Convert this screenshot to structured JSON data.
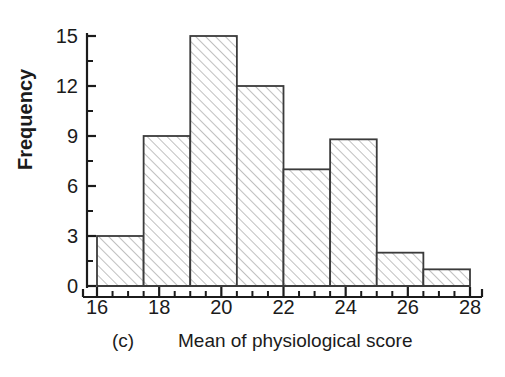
{
  "figure": {
    "panel_tag": "(c)",
    "caption": "Mean of physiological score",
    "ylabel": "Frequency"
  },
  "axes": {
    "y_ticks_major": [
      "0",
      "3",
      "6",
      "9",
      "12",
      "15"
    ],
    "x_ticks_major": [
      "16",
      "18",
      "20",
      "22",
      "24",
      "26",
      "28"
    ]
  },
  "style": {
    "ink": "#1b1b1b",
    "bar_edge": "#3b3b3b",
    "hatch": "#8c8c8c",
    "bar_face": "#ffffff"
  },
  "chart_data": {
    "type": "bar",
    "title": "",
    "subtitle": "",
    "xlabel": "Mean of physiological score",
    "ylabel": "Frequency",
    "xlim": [
      16,
      28
    ],
    "ylim": [
      0,
      15
    ],
    "grid": false,
    "legend": "none",
    "bin_width": 1.5,
    "bin_edges": [
      16,
      17.5,
      19,
      20.5,
      22,
      23.5,
      25,
      26.5,
      28
    ],
    "categories": [
      "16-17.5",
      "17.5-19",
      "19-20.5",
      "20.5-22",
      "22-23.5",
      "23.5-25",
      "25-26.5",
      "26.5-28"
    ],
    "values": [
      3,
      9,
      15,
      12,
      7,
      8.8,
      2,
      1
    ],
    "y_tick_values": [
      0,
      3,
      6,
      9,
      12,
      15
    ],
    "y_minor_tick_values": [
      1.5,
      4.5,
      7.5,
      10.5,
      13.5
    ],
    "x_tick_values": [
      16,
      18,
      20,
      22,
      24,
      26,
      28
    ],
    "x_minor_step": 0.5,
    "annotations": [
      "(c)"
    ]
  }
}
